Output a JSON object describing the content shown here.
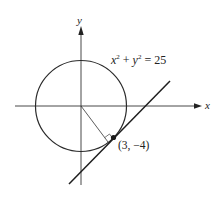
{
  "figure": {
    "type": "tangent-line-to-circle",
    "axes": {
      "x_label": "x",
      "y_label": "y"
    },
    "circle": {
      "equation_parts": {
        "x": "x",
        "xexp": "2",
        "plus": " + ",
        "y": "y",
        "yexp": "2",
        "rhs": " = 25"
      },
      "radius": 5,
      "center": [
        0,
        0
      ]
    },
    "point": {
      "label": "(3, −4)",
      "coords": [
        3,
        -4
      ]
    },
    "tangent_line": {
      "note": "tangent to circle at point, perpendicular to radius"
    },
    "colors": {
      "stroke": "#2a2a2a",
      "background": "#ffffff"
    }
  }
}
